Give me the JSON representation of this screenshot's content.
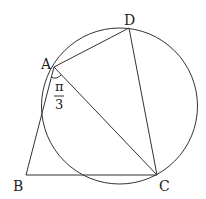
{
  "diagram": {
    "type": "geometry",
    "points": {
      "A": {
        "label": "A",
        "x": 54,
        "y": 67
      },
      "B": {
        "label": "B",
        "x": 26,
        "y": 175
      },
      "C": {
        "label": "C",
        "x": 157,
        "y": 175
      },
      "D": {
        "label": "D",
        "x": 129,
        "y": 28
      }
    },
    "circle": {
      "cx": 119.5,
      "cy": 106,
      "r": 78
    },
    "segments": [
      "AB",
      "BC",
      "AC",
      "AD",
      "DC"
    ],
    "angle_mark": {
      "vertex": "A",
      "between": [
        "AB",
        "AC"
      ],
      "numerator": "π",
      "denominator": "3"
    },
    "colors": {
      "stroke": "#333333",
      "background": "#ffffff"
    }
  }
}
